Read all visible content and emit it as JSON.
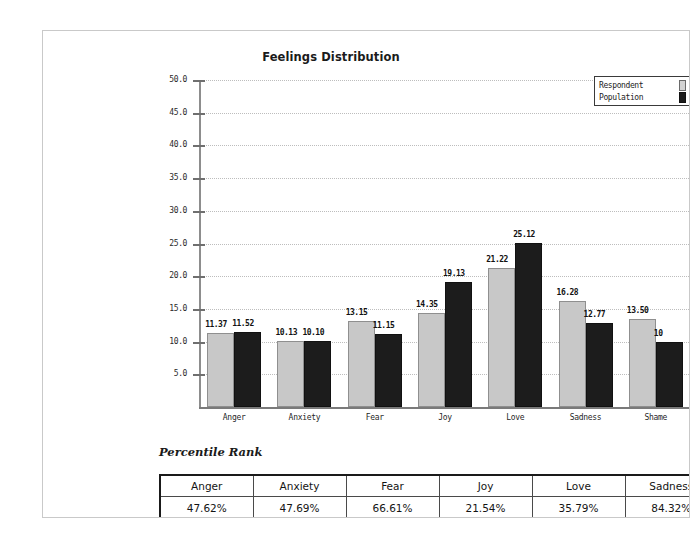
{
  "chart_data": {
    "type": "bar",
    "title": "Feelings Distribution",
    "xlabel": "",
    "ylabel": "",
    "ylim": [
      0,
      50
    ],
    "ytick_step": 5,
    "grid": true,
    "legend_position": "top-right",
    "categories": [
      "Anger",
      "Anxiety",
      "Fear",
      "Joy",
      "Love",
      "Sadness",
      "Shame"
    ],
    "ytick_labels": [
      "50.0",
      "45.0",
      "40.0",
      "35.0",
      "30.0",
      "25.0",
      "20.0",
      "15.0",
      "10.0",
      "5.0"
    ],
    "series": [
      {
        "name": "Respondent",
        "color": "#c8c8c8",
        "values": [
          11.37,
          10.13,
          13.15,
          14.35,
          21.22,
          16.28,
          13.5
        ],
        "labels": [
          "11.37",
          "10.13",
          "13.15",
          "14.35",
          "21.22",
          "16.28",
          "13.50"
        ]
      },
      {
        "name": "Population",
        "color": "#1c1c1c",
        "values": [
          11.52,
          10.1,
          11.15,
          19.13,
          25.12,
          12.77,
          10.0
        ],
        "labels": [
          "11.52",
          "10.10",
          "11.15",
          "19.13",
          "25.12",
          "12.77",
          "10"
        ]
      }
    ]
  },
  "chart": {
    "title": "Feelings Distribution",
    "legend": {
      "respondent_label": "Respondent",
      "population_label": "Population"
    }
  },
  "percentile_section": {
    "heading": "Percentile Rank",
    "columns": [
      "Anger",
      "Anxiety",
      "Fear",
      "Joy",
      "Love",
      "Sadness"
    ],
    "values": [
      "47.62%",
      "47.69%",
      "66.61%",
      "21.54%",
      "35.79%",
      "84.32%"
    ]
  }
}
